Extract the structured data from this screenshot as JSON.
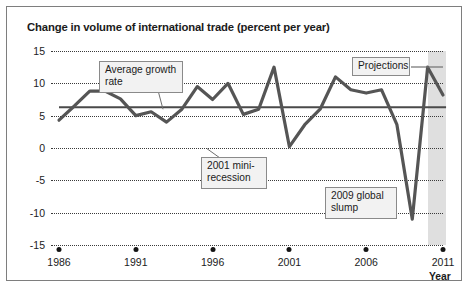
{
  "chart_data": {
    "type": "line",
    "title": "Change in volume of international trade (percent per year)",
    "xlabel": "Year",
    "ylabel": "",
    "xlim": [
      1986,
      2011
    ],
    "ylim": [
      -15,
      15
    ],
    "yticks": [
      "15",
      "10",
      "5",
      "0",
      "-5",
      "-10",
      "-15"
    ],
    "ytick_values": [
      15,
      10,
      5,
      0,
      -5,
      -10,
      -15
    ],
    "xticks": [
      "1986",
      "1991",
      "1996",
      "2001",
      "2006",
      "2011"
    ],
    "xtick_values": [
      1986,
      1991,
      1996,
      2001,
      2006,
      2011
    ],
    "grid": "horizontal-dotted",
    "legend": "none",
    "series": [
      {
        "name": "Change in volume of international trade",
        "x": [
          1986,
          1987,
          1988,
          1989,
          1990,
          1991,
          1992,
          1993,
          1994,
          1995,
          1996,
          1997,
          1998,
          1999,
          2000,
          2001,
          2002,
          2003,
          2004,
          2005,
          2006,
          2007,
          2008,
          2009,
          2010,
          2011
        ],
        "values": [
          4.3,
          6.5,
          8.8,
          8.8,
          7.6,
          5.0,
          5.6,
          4.0,
          6.0,
          9.5,
          7.5,
          10.0,
          5.2,
          6.0,
          12.5,
          0.2,
          3.6,
          6.0,
          11.0,
          9.0,
          8.5,
          9.0,
          3.6,
          -11.0,
          12.5,
          8.2
        ]
      },
      {
        "name": "Average growth rate",
        "type": "reference-line",
        "value": 6.3
      }
    ],
    "projection_band": {
      "start": 2010,
      "end": 2011.2,
      "label": "Projections"
    },
    "annotations": [
      {
        "name": "average-growth-rate",
        "text": "Average growth\nrate"
      },
      {
        "name": "2001-mini-recession",
        "text": "2001 mini-\nrecession"
      },
      {
        "name": "2009-global-slump",
        "text": "2009 global\nslump"
      },
      {
        "name": "projections",
        "text": "Projections"
      }
    ],
    "colors": {
      "line": "#4a4a4a",
      "average_line": "#4a4a4a",
      "grid": "#3a3a3a",
      "projection_band": "#d9d9d9"
    }
  }
}
